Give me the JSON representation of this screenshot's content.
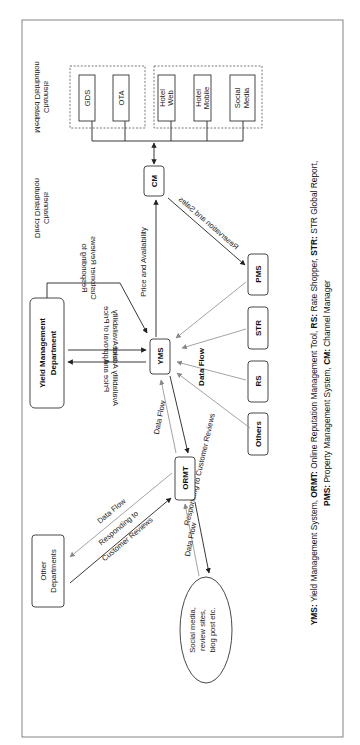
{
  "diagram": {
    "orientation": "rotated -90deg (page turned counter-clockwise)",
    "nodes": {
      "gds": "GDS",
      "ota": "OTA",
      "hotel_web_1": "Hotel",
      "hotel_web_2": "Web",
      "hotel_mobile_1": "Hotel",
      "hotel_mobile_2": "Mobile",
      "social_media_1": "Social",
      "social_media_2": "Media",
      "cm": "CM",
      "yms": "YMS",
      "pms": "PMS",
      "str": "STR",
      "rs": "RS",
      "others": "Others",
      "ormt": "ORMT",
      "ymd_1": "Yield Management",
      "ymd_2": "Department",
      "other_dept_1": "Other",
      "other_dept_2": "Departments",
      "social_sites_1": "Social media,",
      "social_sites_2": "review sites,",
      "social_sites_3": "blog post etc."
    },
    "groups": {
      "mediated_1": "Mediated Distribution",
      "mediated_2": "Channels",
      "direct_1": "Direct Distribution",
      "direct_2": "Channels"
    },
    "edge_labels": {
      "price_availability": "Price and Availability",
      "reservation_sales": "Reservation and Sales",
      "responding_top_1": "Responding to",
      "responding_top_2": "Customer Reviews",
      "approval_1": "Approval of Price",
      "approval_2": "and Availability",
      "advice_1": "Price and",
      "advice_2": "Availability Advice",
      "data_flow_sources": "Data Flow",
      "data_flow_yms_ormt": "Data Flow",
      "responding_ormt": "Responding to Customer Reviews",
      "data_flow_ormt_dept": "Data Flow",
      "responding_dept_1": "Responding to",
      "responding_dept_2": "Customer Reviews",
      "data_flow_social": "Data Flow",
      "responding_social": "Responding to Customer Reviews"
    }
  },
  "caption": {
    "line1": [
      {
        "b": "YMS:",
        "t": " Yield Management System, "
      },
      {
        "b": "ORMT:",
        "t": " Online Reputation Management Tool, "
      },
      {
        "b": "RS:",
        "t": " Rate Shopper, "
      },
      {
        "b": "STR:",
        "t": " STR Global Report,"
      }
    ],
    "line2": [
      {
        "b": "PMS:",
        "t": " Property Management System, "
      },
      {
        "b": "CM:",
        "t": " Channel Manager"
      }
    ],
    "l1_b0": "YMS:",
    "l1_t0": " Yield Management System, ",
    "l1_b1": "ORMT:",
    "l1_t1": " Online Reputation Management Tool, ",
    "l1_b2": "RS:",
    "l1_t2": " Rate Shopper, ",
    "l1_b3": "STR:",
    "l1_t3": " STR Global Report,",
    "l2_b0": "PMS:",
    "l2_t0": " Property Management System, ",
    "l2_b1": "CM:",
    "l2_t1": " Channel Manager"
  },
  "colors": {
    "line": "#222222",
    "grey_line": "#999999",
    "frame": "#777777"
  }
}
